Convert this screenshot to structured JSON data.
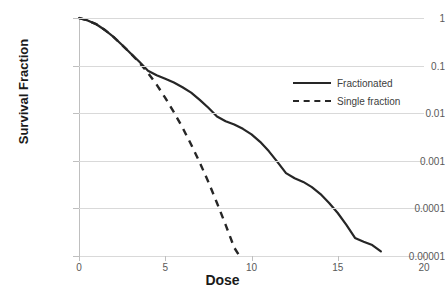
{
  "chart_data": {
    "type": "line",
    "title": "",
    "xlabel": "Dose",
    "ylabel": "Survival Fraction",
    "xlim": [
      0,
      20
    ],
    "ylim": [
      1e-05,
      1
    ],
    "yscale": "log",
    "grid": "horizontal",
    "legend_position": "center-right",
    "x_ticks": [
      "0",
      "5",
      "10",
      "15",
      "20"
    ],
    "x_tick_values": [
      0,
      5,
      10,
      15,
      20
    ],
    "y_ticks": [
      "1",
      "0.1",
      "0.01",
      "0.001",
      "0.0001",
      "0.00001"
    ],
    "y_tick_values": [
      1,
      0.1,
      0.01,
      0.001,
      0.0001,
      1e-05
    ],
    "series": [
      {
        "name": "Fractionated",
        "style": "solid",
        "color": "#262626",
        "x": [
          0,
          0.5,
          1,
          1.5,
          2,
          2.5,
          3,
          3.5,
          4,
          4.5,
          5,
          5.5,
          6,
          6.5,
          7,
          7.5,
          8,
          8.5,
          9,
          9.5,
          10,
          10.5,
          11,
          11.5,
          12,
          12.5,
          13,
          13.5,
          14,
          14.5,
          15,
          15.5,
          16,
          16.5,
          17,
          17.5
        ],
        "y": [
          1,
          0.89,
          0.74,
          0.56,
          0.4,
          0.27,
          0.18,
          0.12,
          0.078,
          0.063,
          0.053,
          0.044,
          0.035,
          0.027,
          0.019,
          0.013,
          0.0085,
          0.0068,
          0.0058,
          0.0047,
          0.0036,
          0.0025,
          0.0016,
          0.00095,
          0.00055,
          0.00043,
          0.00036,
          0.00028,
          0.0002,
          0.00013,
          8e-05,
          4.5e-05,
          2.4e-05,
          2e-05,
          1.7e-05,
          1.25e-05
        ]
      },
      {
        "name": "Single fraction",
        "style": "dashed",
        "color": "#262626",
        "x": [
          0,
          0.5,
          1,
          1.5,
          2,
          2.5,
          3,
          3.5,
          4,
          4.5,
          5,
          5.5,
          6,
          6.5,
          7,
          7.5,
          8,
          8.5,
          9,
          9.3
        ],
        "y": [
          1,
          0.89,
          0.74,
          0.56,
          0.4,
          0.27,
          0.18,
          0.115,
          0.07,
          0.04,
          0.021,
          0.0105,
          0.005,
          0.0022,
          0.00092,
          0.00036,
          0.00013,
          4.5e-05,
          1.5e-05,
          1e-05
        ]
      }
    ]
  },
  "legend": {
    "items": [
      {
        "label": "Fractionated",
        "style": "solid"
      },
      {
        "label": "Single fraction",
        "style": "dashed"
      }
    ]
  }
}
